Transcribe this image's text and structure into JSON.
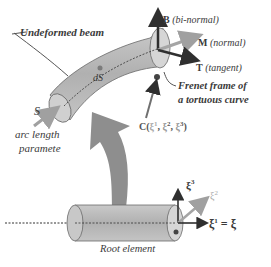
{
  "labels": {
    "undeformed_beam": "Undeformed beam",
    "ds": "dS",
    "s": "S",
    "arc_length_line1": "arc length",
    "arc_length_line2": "paramete",
    "binormal_symbol": "B",
    "binormal_name": "(bi-normal)",
    "normal_symbol": "M",
    "normal_name": "(normal)",
    "tangent_symbol": "T",
    "tangent_name": "(tangent)",
    "frenet_line1": "Frenet frame of",
    "frenet_line2": "a tortuous curve",
    "curve_point_prefix": "C(",
    "curve_point_xi1": "ξ",
    "curve_point_xi2": "ξ",
    "curve_point_xi3": "ξ",
    "curve_point_sup1": "1",
    "curve_point_sup2": "2",
    "curve_point_sup3": "3",
    "curve_point_sep": ",",
    "curve_point_suffix": ")",
    "root_element": "Root element",
    "xi3_axis": "ξ",
    "xi3_sup": "3",
    "xi2_axis": "ξ",
    "xi2_sup": "2",
    "xi1_axis": "ξ",
    "xi1_sup": "1",
    "xi1_equals": "= ξ"
  },
  "colors": {
    "beam_fill": "#b8b8b8",
    "beam_stroke": "#6a6a6a",
    "end_cap": "#d6d6d6",
    "arrow_dark": "#2f2f2f",
    "arrow_light": "#9e9e9e",
    "big_arrow": "#8c8c8c",
    "text": "#3a3a3a"
  }
}
